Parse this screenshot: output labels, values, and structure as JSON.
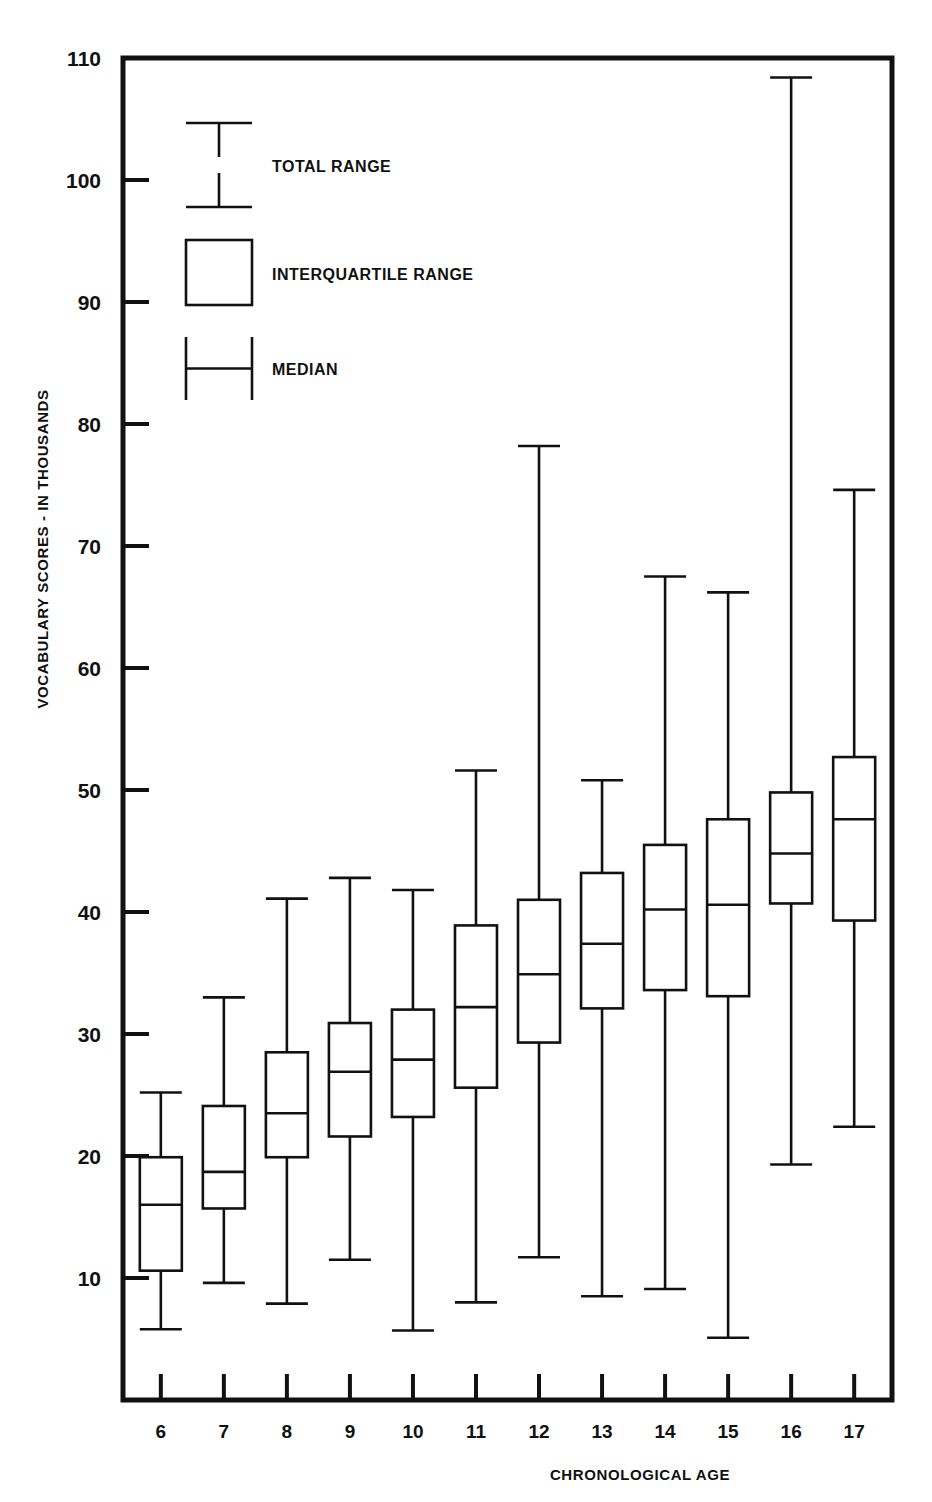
{
  "chart_data": {
    "type": "box",
    "title": "",
    "xlabel": "CHRONOLOGICAL AGE",
    "ylabel": "VOCABULARY SCORES - IN THOUSANDS",
    "xlim": [
      5.4,
      17.6
    ],
    "ylim": [
      0,
      110
    ],
    "grid": false,
    "y_ticks": [
      10,
      20,
      30,
      40,
      50,
      60,
      70,
      80,
      90,
      100,
      110
    ],
    "y_tick_labels": [
      "10",
      "20",
      "30",
      "40",
      "50",
      "60",
      "70",
      "80",
      "90",
      "100",
      "110"
    ],
    "x_ticks": [
      6,
      7,
      8,
      9,
      10,
      11,
      12,
      13,
      14,
      15,
      16,
      17
    ],
    "x_tick_labels": [
      "6",
      "7",
      "8",
      "9",
      "10",
      "11",
      "12",
      "13",
      "14",
      "15",
      "16",
      "17"
    ],
    "legend_position": "upper-left",
    "legend": [
      {
        "key": "total-range",
        "label": "TOTAL RANGE"
      },
      {
        "key": "interquartile-range",
        "label": "INTERQUARTILE RANGE"
      },
      {
        "key": "median",
        "label": "MEDIAN"
      }
    ],
    "categories": [
      "6",
      "7",
      "8",
      "9",
      "10",
      "11",
      "12",
      "13",
      "14",
      "15",
      "16",
      "17"
    ],
    "boxes": [
      {
        "category": "6",
        "min": 5.8,
        "q1": 10.6,
        "median": 16.0,
        "q3": 19.9,
        "max": 25.2
      },
      {
        "category": "7",
        "min": 9.6,
        "q1": 15.7,
        "median": 18.7,
        "q3": 24.1,
        "max": 33.0
      },
      {
        "category": "8",
        "min": 7.9,
        "q1": 19.9,
        "median": 23.5,
        "q3": 28.5,
        "max": 41.1
      },
      {
        "category": "9",
        "min": 11.5,
        "q1": 21.6,
        "median": 26.9,
        "q3": 30.9,
        "max": 42.8
      },
      {
        "category": "10",
        "min": 5.7,
        "q1": 23.2,
        "median": 27.9,
        "q3": 32.0,
        "max": 41.8
      },
      {
        "category": "11",
        "min": 8.0,
        "q1": 25.6,
        "median": 32.2,
        "q3": 38.9,
        "max": 51.6
      },
      {
        "category": "12",
        "min": 11.7,
        "q1": 29.3,
        "median": 34.9,
        "q3": 41.0,
        "max": 78.2
      },
      {
        "category": "13",
        "min": 8.5,
        "q1": 32.1,
        "median": 37.4,
        "q3": 43.2,
        "max": 50.8
      },
      {
        "category": "14",
        "min": 9.1,
        "q1": 33.6,
        "median": 40.2,
        "q3": 45.5,
        "max": 67.5
      },
      {
        "category": "15",
        "min": 5.1,
        "q1": 33.1,
        "median": 40.6,
        "q3": 47.6,
        "max": 66.2
      },
      {
        "category": "16",
        "min": 19.3,
        "q1": 40.7,
        "median": 44.8,
        "q3": 49.8,
        "max": 108.4
      },
      {
        "category": "17",
        "min": 22.4,
        "q1": 39.3,
        "median": 47.6,
        "q3": 52.7,
        "max": 74.6
      }
    ],
    "colors": {
      "ink": "#111111",
      "background": "#ffffff"
    }
  }
}
